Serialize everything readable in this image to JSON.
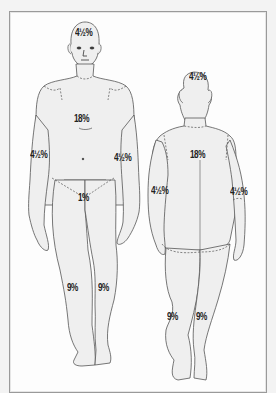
{
  "diagram": {
    "type": "rule-of-nines-body-chart",
    "views": [
      {
        "name": "anterior",
        "regions": [
          {
            "id": "head",
            "label": "4½%"
          },
          {
            "id": "trunk",
            "label": "18%"
          },
          {
            "id": "right-arm",
            "label": "4½%"
          },
          {
            "id": "left-arm",
            "label": "4½%"
          },
          {
            "id": "genitals",
            "label": "1%"
          },
          {
            "id": "right-leg",
            "label": "9%"
          },
          {
            "id": "left-leg",
            "label": "9%"
          }
        ]
      },
      {
        "name": "posterior",
        "regions": [
          {
            "id": "head",
            "label": "4½%"
          },
          {
            "id": "trunk",
            "label": "18%"
          },
          {
            "id": "left-arm",
            "label": "4½%"
          },
          {
            "id": "right-arm",
            "label": "4½%"
          },
          {
            "id": "left-leg",
            "label": "9%"
          },
          {
            "id": "right-leg",
            "label": "9%"
          }
        ]
      }
    ],
    "colors": {
      "background": "#f3f3f3",
      "panel": "#fdfdfd",
      "body_fill": "#efefef",
      "outline": "#555555",
      "label": "#222222"
    }
  }
}
